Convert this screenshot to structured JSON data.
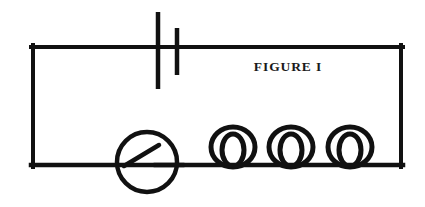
{
  "figure": {
    "caption": "FIGURE I",
    "background_color": "#ffffff",
    "ink_color": "#111111",
    "width": 425,
    "height": 207
  },
  "circuit": {
    "title": "FIGURE I",
    "description": "Series circuit loop containing a battery cell, a meter with pointer, and three coil loops",
    "loop": {
      "left_x": 31,
      "right_x": 403,
      "top_y": 47,
      "bottom_y": 165,
      "stroke_width": 4
    },
    "components": [
      {
        "name": "battery",
        "type": "cell",
        "label": "",
        "long_plate_x": 158,
        "long_plate_top": 12,
        "long_plate_bottom": 89,
        "short_plate_x": 177,
        "short_plate_top": 28,
        "short_plate_bottom": 75,
        "stroke_width": 4
      },
      {
        "name": "meter",
        "type": "circle-with-pointer",
        "label": "",
        "center_x": 147,
        "center_y": 162,
        "radius": 30,
        "pointer_start_x": 124,
        "pointer_start_y": 166,
        "pointer_end_x": 159,
        "pointer_end_y": 145,
        "stub_start_x": 154,
        "stub_start_y": 165,
        "stub_end_x": 183,
        "stub_end_y": 165,
        "stroke_width": 4
      },
      {
        "name": "coil-1",
        "type": "inductor-loop",
        "label": "",
        "center_x": 233,
        "outer_cy": 147,
        "outer_rx": 22,
        "outer_ry": 20,
        "inner_rx": 11,
        "inner_ry": 16,
        "stroke_width": 5
      },
      {
        "name": "coil-2",
        "type": "inductor-loop",
        "label": "",
        "center_x": 291,
        "outer_cy": 147,
        "outer_rx": 22,
        "outer_ry": 20,
        "inner_rx": 11,
        "inner_ry": 16,
        "stroke_width": 5
      },
      {
        "name": "coil-3",
        "type": "inductor-loop",
        "label": "",
        "center_x": 350,
        "outer_cy": 147,
        "outer_rx": 22,
        "outer_ry": 20,
        "inner_rx": 11,
        "inner_ry": 16,
        "stroke_width": 5
      }
    ]
  }
}
